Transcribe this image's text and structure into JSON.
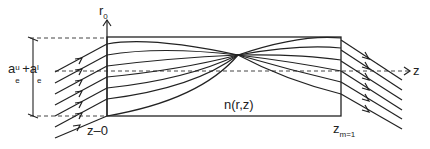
{
  "diagram": {
    "axis_r_label": "r",
    "axis_r_sub": "0",
    "axis_z_label": "z",
    "medium_label": "n(r,z)",
    "entrance_label": "z–0",
    "exit_label_main": "z",
    "exit_label_sub": "m=1",
    "aperture_label": {
      "a1": "a",
      "a1_sup": "u",
      "a1_sub": "e",
      "plus": "+",
      "a2": "a",
      "a2_sup": "l",
      "a2_sub": "e"
    },
    "colors": {
      "stroke": "#222222",
      "dashed": "#444444"
    }
  }
}
